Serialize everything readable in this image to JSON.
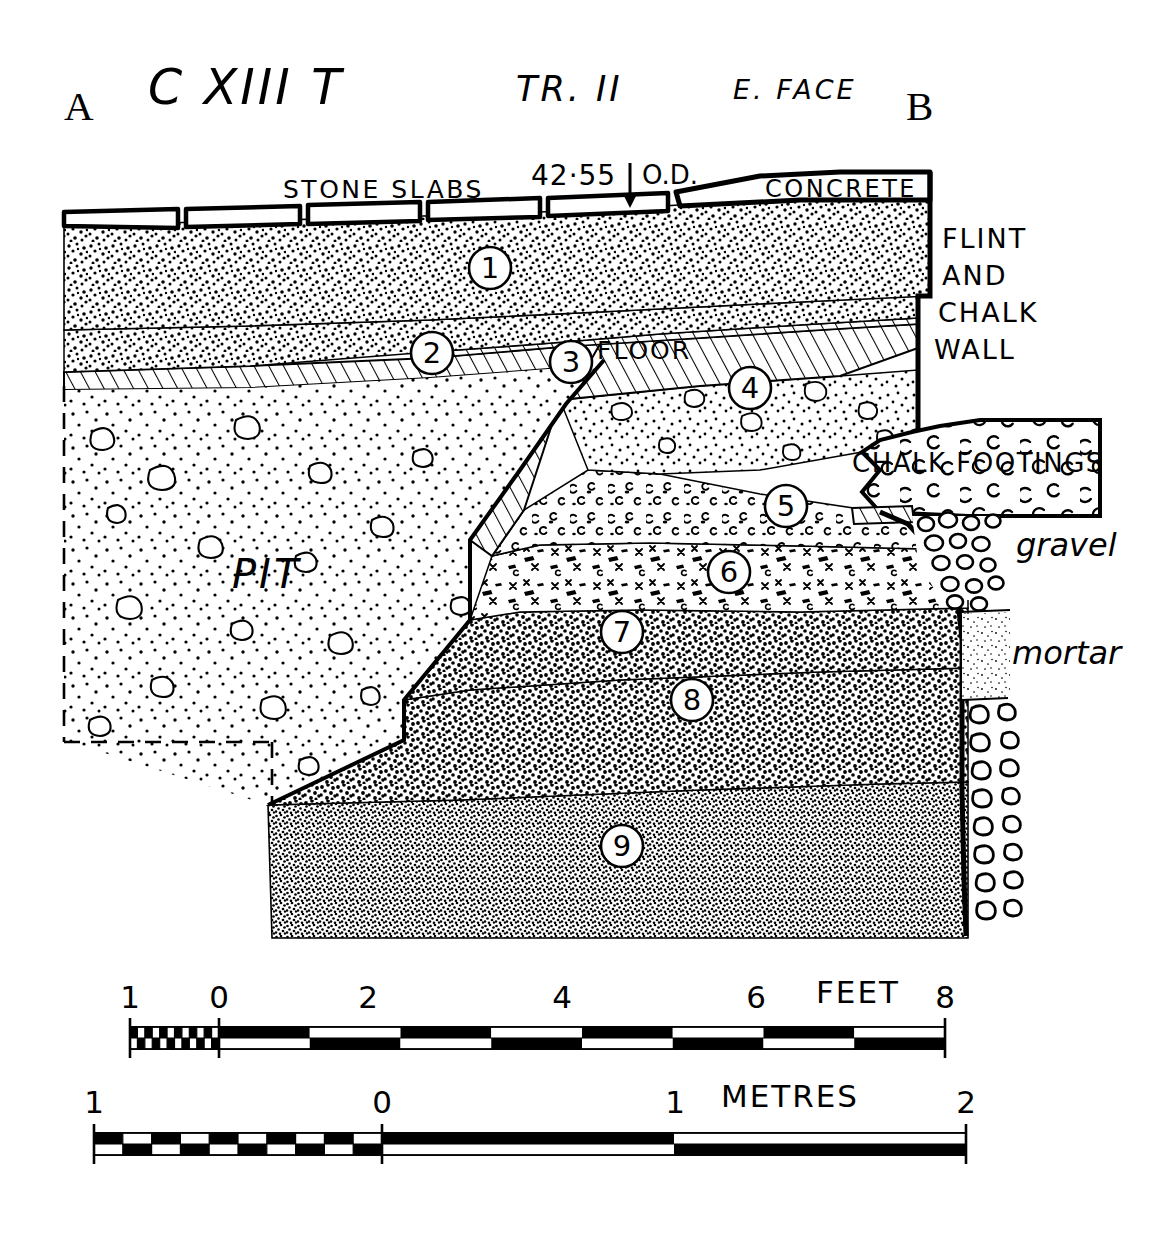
{
  "figure": {
    "title_main": "C XIII T",
    "title_trench": "TR. II",
    "title_face": "E. FACE",
    "end_marker_left": "A",
    "end_marker_right": "B",
    "type": "archaeological section drawing"
  },
  "annotations": {
    "stone_slabs": "STONE SLABS",
    "datum_value": "42·55",
    "datum_unit": "O.D.",
    "concrete": "CONCRETE",
    "wall_line1": "FLINT",
    "wall_line2": "AND",
    "wall_line3": "CHALK",
    "wall_line4": "WALL",
    "floor": "FLOOR",
    "pit": "PIT",
    "chalk_footings": "CHALK FOOTINGS",
    "gravel": "gravel",
    "mortar": "mortar"
  },
  "layers": [
    {
      "number": "1",
      "cx": 490,
      "cy": 268,
      "fill": "topsoil-stipple"
    },
    {
      "number": "2",
      "cx": 432,
      "cy": 353,
      "fill": "topsoil-stipple"
    },
    {
      "number": "3",
      "cx": 571,
      "cy": 362,
      "fill": "hatch-floor"
    },
    {
      "number": "4",
      "cx": 750,
      "cy": 388,
      "fill": "flinty-stipple"
    },
    {
      "number": "5",
      "cx": 786,
      "cy": 506,
      "fill": "chalk-fleck"
    },
    {
      "number": "6",
      "cx": 729,
      "cy": 572,
      "fill": "charcoal-cross"
    },
    {
      "number": "7",
      "cx": 622,
      "cy": 632,
      "fill": "dense-stipple"
    },
    {
      "number": "8",
      "cx": 692,
      "cy": 700,
      "fill": "dense-stipple"
    },
    {
      "number": "9",
      "cx": 622,
      "cy": 846,
      "fill": "fine-stipple"
    }
  ],
  "scales": [
    {
      "name": "feet",
      "unit_label": "FEET",
      "ticks": [
        "1",
        "0",
        "2",
        "4",
        "6",
        "8"
      ],
      "tick_x": [
        130,
        219,
        368,
        562,
        756,
        945
      ],
      "bar_left": 130,
      "bar_right": 945,
      "zero_x": 219,
      "bar_y": 1027,
      "bar_h": 22,
      "label_y": 1008,
      "unit_x": 858,
      "unit_y": 1003
    },
    {
      "name": "metres",
      "unit_label": "METRES",
      "ticks": [
        "1",
        "0",
        "1",
        "2"
      ],
      "tick_x": [
        94,
        382,
        675,
        966
      ],
      "bar_left": 94,
      "bar_right": 966,
      "zero_x": 382,
      "bar_y": 1133,
      "bar_h": 22,
      "label_y": 1113,
      "unit_x": 790,
      "unit_y": 1107
    }
  ],
  "colors": {
    "ink": "#000000",
    "paper": "#ffffff"
  }
}
